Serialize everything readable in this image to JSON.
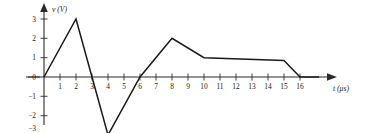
{
  "figure": {
    "name": "voltage-waveform-plot"
  },
  "axes": {
    "y": {
      "title": "v (V)",
      "title_symbol": "v",
      "title_unit": "(V)",
      "ticks": [
        "3",
        "2",
        "1",
        "0",
        "−1",
        "−2",
        "−3"
      ],
      "tick_values": [
        3,
        2,
        1,
        0,
        -1,
        -2,
        -3
      ],
      "range": [
        -3.5,
        3.4
      ]
    },
    "x": {
      "title": "t (μs)",
      "title_symbol": "t",
      "title_unit": "(μs)",
      "ticks": [
        "1",
        "2",
        "3",
        "4",
        "5",
        "6",
        "7",
        "8",
        "9",
        "10",
        "11",
        "12",
        "13",
        "14",
        "15",
        "16"
      ],
      "tick_values": [
        1,
        2,
        3,
        4,
        5,
        6,
        7,
        8,
        9,
        10,
        11,
        12,
        13,
        14,
        15,
        16
      ],
      "range": [
        0,
        17.6
      ]
    }
  },
  "colors": {
    "curve": "#1a1a1a",
    "axis": "#2b2b2b",
    "background": "#ffffff"
  },
  "chart_data": {
    "type": "line",
    "title": "",
    "xlabel": "t (μs)",
    "ylabel": "v (V)",
    "xlim": [
      0,
      17.6
    ],
    "ylim": [
      -3.5,
      3.4
    ],
    "grid": false,
    "legend": false,
    "series": [
      {
        "name": "v(t)",
        "x": [
          0,
          2,
          3,
          4,
          6,
          8,
          10,
          15,
          16,
          17.2
        ],
        "y": [
          0,
          3,
          0,
          -3,
          0,
          2,
          1,
          0.85,
          0,
          0
        ]
      }
    ],
    "annotations": [
      {
        "label": "peak",
        "x": 2,
        "y": 3
      },
      {
        "label": "trough",
        "x": 4,
        "y": -3
      },
      {
        "label": "second-peak",
        "x": 8,
        "y": 2
      },
      {
        "label": "plateau-start",
        "x": 10,
        "y": 1
      },
      {
        "label": "plateau-end",
        "x": 15,
        "y": 0.85
      },
      {
        "label": "end",
        "x": 16,
        "y": 0
      }
    ]
  }
}
